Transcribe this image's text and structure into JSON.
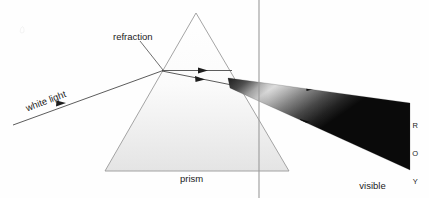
{
  "diagram": {
    "background_color": "#fefefe",
    "line_color": "#4a4a4a",
    "text_color": "#1b1b1b",
    "labels": {
      "white_light": "white light",
      "refraction": "refraction",
      "prism": "prism",
      "visible_line1": "visible",
      "visible_line2": "spectrum"
    },
    "spectrum_letters": [
      "R",
      "O",
      "Y",
      "G",
      "B",
      "I",
      "V"
    ],
    "prism": {
      "apex": [
        196,
        13
      ],
      "base_left": [
        105,
        171
      ],
      "base_right": [
        289,
        171
      ],
      "fill_top_color": "#ffffff",
      "fill_bottom_color": "#e6e6e6",
      "stroke_color": "#9a9a9a"
    },
    "incoming_ray": {
      "from": [
        13,
        125
      ],
      "to": [
        162,
        71
      ],
      "arrow_at": [
        60,
        107
      ]
    },
    "internal_rays": [
      {
        "from": [
          162,
          71
        ],
        "to": [
          231,
          71
        ],
        "arrow_at": [
          104,
          71
        ]
      },
      {
        "from": [
          162,
          71
        ],
        "to": [
          231,
          84
        ],
        "arrow_at": [
          103,
          79
        ]
      }
    ],
    "leader_line": {
      "from": [
        140,
        40
      ],
      "to": [
        163,
        70
      ]
    },
    "vertical_line": {
      "x": 259,
      "from_y": 0,
      "to_y": 198,
      "color": "#9a9a9a"
    },
    "beam": {
      "origin_top": [
        228,
        78
      ],
      "origin_bottom": [
        230,
        88
      ],
      "end_top": [
        410,
        103
      ],
      "end_bottom": [
        410,
        170
      ],
      "arrow_1": [
        312,
        88
      ],
      "arrow_2": [
        306,
        122
      ]
    }
  }
}
